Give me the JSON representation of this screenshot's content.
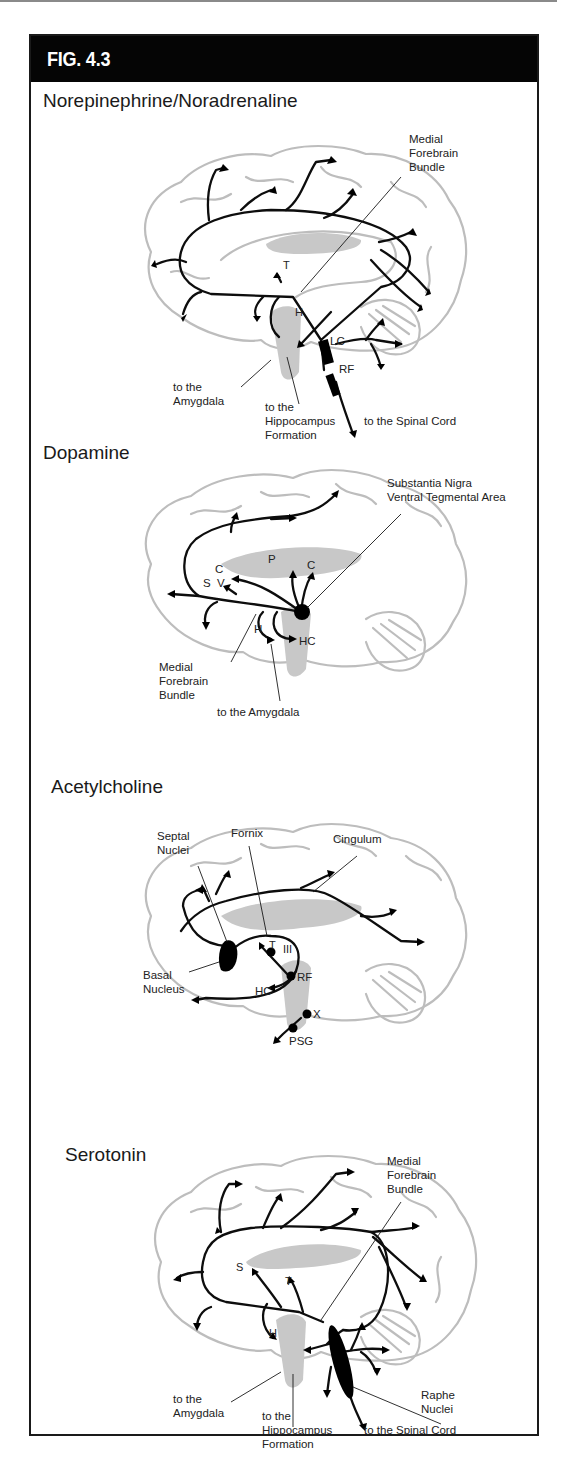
{
  "figure": {
    "title": "FIG. 4.3",
    "header_color": "#050505",
    "outline_color": "#bdbdbd",
    "pathway_color": "#0d0d0d"
  },
  "sections": [
    {
      "title": "Norepinephrine/Noradrenaline",
      "origin_nuclei": [
        "LC",
        "RF"
      ],
      "labels": {
        "mfb_1": "Medial",
        "mfb_2": "Forebrain",
        "mfb_3": "Bundle",
        "t": "T",
        "h": "H",
        "lc": "LC",
        "rf": "RF",
        "amyg_1": "to the",
        "amyg_2": "Amygdala",
        "hipp_1": "to the",
        "hipp_2": "Hippocampus",
        "hipp_3": "Formation",
        "spinal": "to the Spinal Cord"
      }
    },
    {
      "title": "Dopamine",
      "origin_nuclei": [
        "Substantia Nigra",
        "Ventral Tegmental Area"
      ],
      "labels": {
        "sn": "Substantia Nigra",
        "vta": "Ventral Tegmental Area",
        "c1": "C",
        "s": "S",
        "v": "V",
        "p": "P",
        "c2": "C",
        "h": "H",
        "hc": "HC",
        "mfb_1": "Medial",
        "mfb_2": "Forebrain",
        "mfb_3": "Bundle",
        "amyg": "to the Amygdala"
      }
    },
    {
      "title": "Acetylcholine",
      "origin_nuclei": [
        "Septal Nuclei",
        "Basal Nucleus"
      ],
      "labels": {
        "septal_1": "Septal",
        "septal_2": "Nuclei",
        "fornix": "Fornix",
        "cingulum": "Cingulum",
        "basal_1": "Basal",
        "basal_2": "Nucleus",
        "t": "T",
        "iii": "III",
        "rf": "RF",
        "hc": "HC",
        "x": "X",
        "psg": "PSG"
      }
    },
    {
      "title": "Serotonin",
      "origin_nuclei": [
        "Raphe Nuclei"
      ],
      "labels": {
        "mfb_1": "Medial",
        "mfb_2": "Forebrain",
        "mfb_3": "Bundle",
        "s": "S",
        "t": "T",
        "h": "H",
        "amyg_1": "to the",
        "amyg_2": "Amygdala",
        "hipp_1": "to the",
        "hipp_2": "Hippocampus",
        "hipp_3": "Formation",
        "raphe_1": "Raphe",
        "raphe_2": "Nuclei",
        "spinal": "to the Spinal Cord"
      }
    }
  ]
}
